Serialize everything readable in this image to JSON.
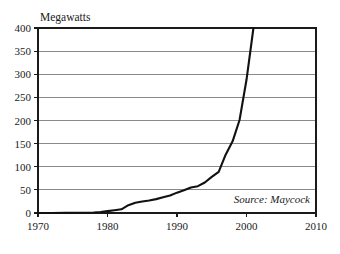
{
  "chart_data": {
    "type": "line",
    "title": "",
    "ylabel": "Megawatts",
    "xlabel": "",
    "xlim": [
      1970,
      2010
    ],
    "ylim": [
      0,
      400
    ],
    "grid": true,
    "legend": null,
    "annotation": "Source: Maycock",
    "yticks": [
      0,
      50,
      100,
      150,
      200,
      250,
      300,
      350,
      400
    ],
    "ytick_labels": [
      "0",
      "50",
      "100",
      "150",
      "200",
      "250",
      "300",
      "350",
      "400"
    ],
    "xticks": [
      1970,
      1980,
      1990,
      2000,
      2010
    ],
    "xtick_labels": [
      "1970",
      "1980",
      "1990",
      "2000",
      "2010"
    ],
    "series": [
      {
        "name": "Megawatts",
        "color": "#111111",
        "x": [
          1970,
          1972,
          1974,
          1976,
          1978,
          1979,
          1980,
          1981,
          1982,
          1983,
          1984,
          1985,
          1986,
          1987,
          1988,
          1989,
          1990,
          1991,
          1992,
          1993,
          1994,
          1995,
          1996,
          1997,
          1998,
          1999,
          2000,
          2001
        ],
        "y": [
          0,
          0.1,
          0.3,
          0.5,
          1,
          2,
          4,
          6,
          8,
          17,
          22,
          25,
          27,
          30,
          34,
          38,
          44,
          49,
          55,
          58,
          66,
          78,
          89,
          126,
          155,
          201,
          288,
          400
        ]
      }
    ]
  },
  "colors": {
    "grid": "#8a8a8a",
    "axis": "#1a1a1a",
    "line": "#111111",
    "background": "#ffffff"
  }
}
